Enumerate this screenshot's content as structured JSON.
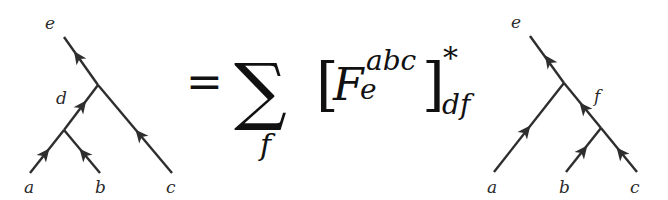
{
  "diagram": {
    "colors": {
      "line": "#2e2e2e",
      "text": "#111111",
      "background": "#ffffff"
    },
    "left_tree": {
      "labels": {
        "top": "e",
        "internal": "d",
        "leaf_1": "a",
        "leaf_2": "b",
        "leaf_3": "c"
      }
    },
    "equation": {
      "equals": "=",
      "sum_symbol": "∑",
      "sum_index": "f",
      "left_bracket": "[",
      "symbol": "F",
      "superscript": "abc",
      "subscript": "e",
      "right_bracket": "]",
      "conjugate": "*",
      "outer_subscript": "df"
    },
    "right_tree": {
      "labels": {
        "top": "e",
        "internal": "f",
        "leaf_1": "a",
        "leaf_2": "b",
        "leaf_3": "c"
      }
    }
  }
}
